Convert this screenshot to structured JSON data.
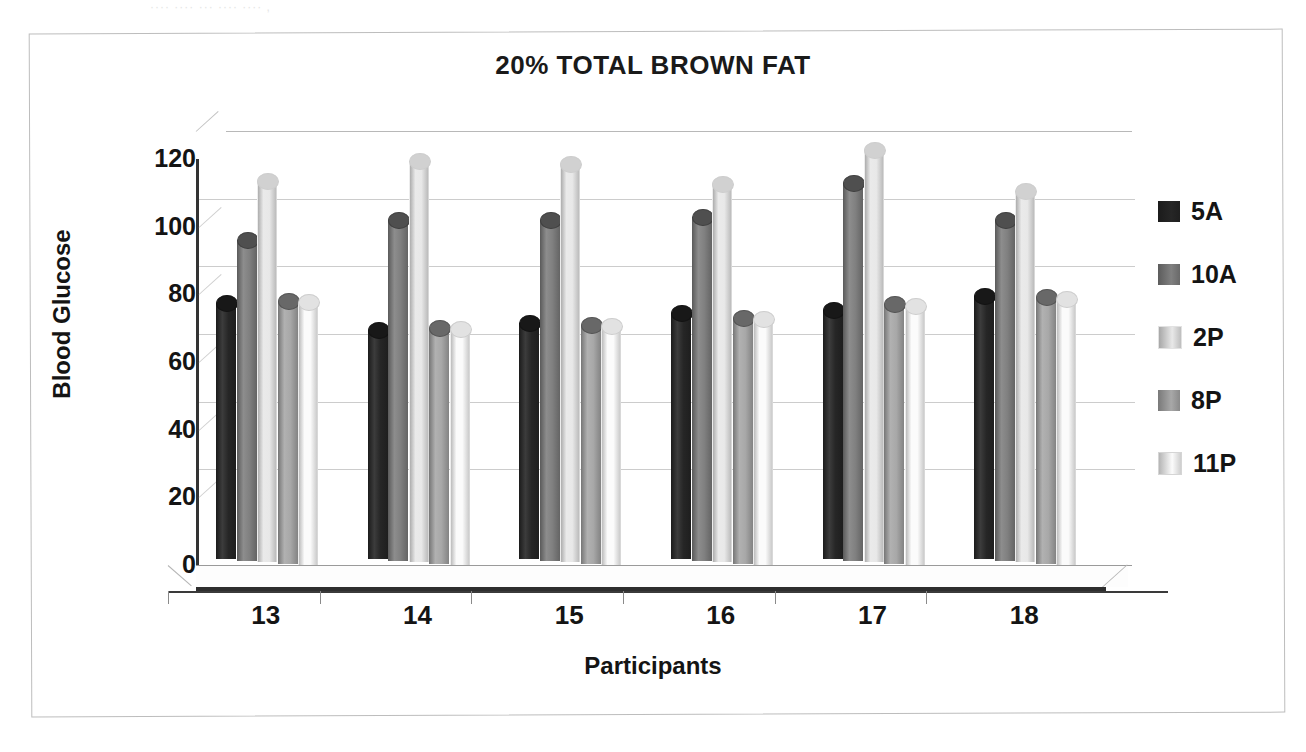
{
  "scan_artifact_text": "···· ···· ···  ···· ···· ,",
  "chart_data": {
    "type": "bar",
    "title": "20% TOTAL BROWN FAT",
    "xlabel": "Participants",
    "ylabel": "Blood Glucose",
    "categories": [
      "13",
      "14",
      "15",
      "16",
      "17",
      "18"
    ],
    "ylim": [
      0,
      120
    ],
    "yticks": [
      "0",
      "20",
      "40",
      "60",
      "80",
      "100",
      "120"
    ],
    "grid": true,
    "legend_position": "right",
    "style": "3d-cylinder",
    "series": [
      {
        "name": "5A",
        "color": "#262626",
        "values": [
          78,
          70,
          72,
          75,
          76,
          80
        ]
      },
      {
        "name": "10A",
        "color": "#808080",
        "values": [
          97,
          103,
          103,
          104,
          114,
          103
        ]
      },
      {
        "name": "2P",
        "color": "#e8e8e8",
        "values": [
          115,
          121,
          120,
          114,
          124,
          112
        ]
      },
      {
        "name": "8P",
        "color": "#a8a8a8",
        "values": [
          80,
          72,
          73,
          75,
          79,
          81
        ]
      },
      {
        "name": "11P",
        "color": "#fbfbfb",
        "values": [
          80,
          72,
          73,
          75,
          79,
          81
        ]
      }
    ]
  },
  "legend": {
    "items": [
      {
        "label": "5A"
      },
      {
        "label": "10A"
      },
      {
        "label": "2P"
      },
      {
        "label": "8P"
      },
      {
        "label": "11P"
      }
    ]
  }
}
